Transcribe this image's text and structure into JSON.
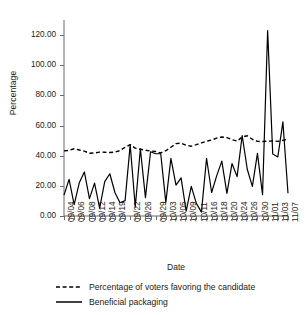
{
  "chart_data": {
    "type": "line",
    "title": "",
    "xlabel": "Date",
    "ylabel": "Percentage",
    "ylim": [
      0,
      130
    ],
    "yticks": [
      "0.00",
      "20.00",
      "40.00",
      "60.00",
      "80.00",
      "100.00",
      "120.00"
    ],
    "ytick_values": [
      0,
      20,
      40,
      60,
      80,
      100,
      120
    ],
    "grid": false,
    "legend_position": "below",
    "x": [
      "09/04",
      "09/05",
      "09/06",
      "09/07",
      "09/08",
      "09/11",
      "09/12",
      "09/13",
      "09/14",
      "09/18",
      "09/19",
      "09/20",
      "09/21",
      "09/22",
      "09/25",
      "09/26",
      "09/27",
      "09/28",
      "09/29",
      "10/02",
      "10/03",
      "10/04",
      "10/05",
      "10/06",
      "10/09",
      "10/10",
      "10/11",
      "10/12",
      "10/16",
      "10/17",
      "10/18",
      "10/19",
      "10/20",
      "10/23",
      "10/24",
      "10/25",
      "10/26",
      "10/27",
      "10/30",
      "10/31",
      "11/01",
      "11/02",
      "11/03",
      "11/06",
      "11/07"
    ],
    "xtick_labels": [
      "09/04",
      "09/06",
      "09/08",
      "09/12",
      "09/14",
      "09/19",
      "09/22",
      "09/26",
      "09/29",
      "10/03",
      "10/05",
      "10/09",
      "10/11",
      "10/16",
      "10/18",
      "10/20",
      "10/24",
      "10/26",
      "10/30",
      "11/01",
      "11/03",
      "11/07"
    ],
    "series": [
      {
        "name": "Percentage of voters favoring the candidate",
        "style": "dashed",
        "color": "#000000",
        "values": [
          43.2,
          43.5,
          44.6,
          43.8,
          43.0,
          41.6,
          41.8,
          42.4,
          42.3,
          42.1,
          42.4,
          43.4,
          45.6,
          47.3,
          45.0,
          44.3,
          43.6,
          43.1,
          42.8,
          41.8,
          43.3,
          45.6,
          48.0,
          48.3,
          46.9,
          46.3,
          47.3,
          48.5,
          49.6,
          50.4,
          51.7,
          52.4,
          52.0,
          50.6,
          49.7,
          52.4,
          53.2,
          50.9,
          49.5,
          49.4,
          49.6,
          49.8,
          49.5,
          50.2,
          51.0
        ]
      },
      {
        "name": "Beneficial packaging",
        "style": "solid",
        "color": "#000000",
        "values": [
          13.8,
          24.3,
          7.6,
          22.0,
          29.2,
          11.5,
          21.8,
          5.2,
          22.8,
          28.0,
          15.6,
          8.8,
          10.2,
          47.2,
          6.0,
          44.6,
          12.2,
          42.6,
          41.3,
          41.3,
          9.0,
          38.2,
          20.5,
          25.3,
          3.2,
          19.7,
          8.4,
          2.6,
          38.3,
          15.6,
          26.8,
          36.4,
          15.0,
          34.8,
          26.1,
          53.4,
          31.0,
          19.6,
          41.5,
          14.2,
          123.0,
          41.1,
          39.2,
          62.4,
          15.1
        ]
      }
    ]
  },
  "legend": [
    {
      "label": "Percentage of voters favoring the candidate",
      "style": "dashed"
    },
    {
      "label": "Beneficial packaging",
      "style": "solid"
    }
  ]
}
